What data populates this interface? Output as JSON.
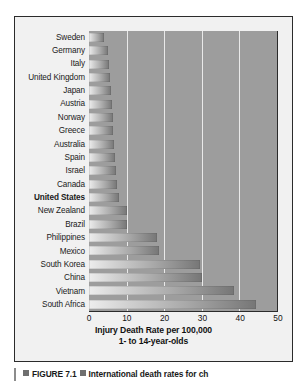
{
  "figure": {
    "caption_label": "FIGURE 7.1",
    "caption_title": "International death rates for ch",
    "caption_marker_icon": "square-bullet-icon"
  },
  "chart": {
    "axis_title_main": "Injury Death Rate per 100,000",
    "axis_title_sub": "1- to 14-year-olds",
    "highlight_category": "United States",
    "plot_background": "#9d9d9d",
    "gridline_color": "#e9e9e9",
    "bar_gradient_start": "#ededed",
    "bar_gradient_end": "#767676"
  },
  "chart_data": {
    "type": "bar",
    "orientation": "horizontal",
    "title": "",
    "xlabel": "Injury Death Rate per 100,000",
    "ylabel": "",
    "xlim": [
      0,
      50
    ],
    "ticks": [
      0,
      10,
      20,
      30,
      40,
      50
    ],
    "tick_labels": [
      "0",
      "10",
      "20",
      "30",
      "40",
      "50"
    ],
    "grid": true,
    "legend": "none",
    "categories": [
      "Sweden",
      "Germany",
      "Italy",
      "United Kingdom",
      "Japan",
      "Austria",
      "Norway",
      "Greece",
      "Australia",
      "Spain",
      "Israel",
      "Canada",
      "United States",
      "New Zealand",
      "Brazil",
      "Philippines",
      "Mexico",
      "South Korea",
      "China",
      "Vietnam",
      "South Africa"
    ],
    "values": [
      4.0,
      5.0,
      5.3,
      5.5,
      5.8,
      6.0,
      6.3,
      6.5,
      6.7,
      7.0,
      7.2,
      7.5,
      8.0,
      10.0,
      10.2,
      18.0,
      18.5,
      29.5,
      30.0,
      38.5,
      44.5
    ],
    "units": "deaths per 100,000 children aged 1-14"
  }
}
